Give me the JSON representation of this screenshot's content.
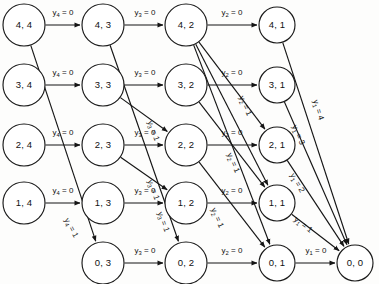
{
  "diagram": {
    "type": "directed-acyclic-network",
    "colors": {
      "background": "#fdfdfc",
      "node_fill": "#ffffff",
      "stroke": "#151515",
      "text": "#111111"
    },
    "columns": [
      {
        "id": "c4",
        "stage_label": "4",
        "x": 24
      },
      {
        "id": "c3",
        "stage_label": "3",
        "x": 103
      },
      {
        "id": "c2",
        "stage_label": "2",
        "x": 186
      },
      {
        "id": "c1",
        "stage_label": "1",
        "x": 277
      },
      {
        "id": "c0",
        "stage_label": "0",
        "x": 355
      }
    ],
    "rows": [
      {
        "id": "r4",
        "state_label": "4",
        "y": 25
      },
      {
        "id": "r3",
        "state_label": "3",
        "y": 85
      },
      {
        "id": "r2",
        "state_label": "2",
        "y": 145
      },
      {
        "id": "r1",
        "state_label": "1",
        "y": 203
      },
      {
        "id": "r0",
        "state_label": "0",
        "y": 263
      }
    ],
    "nodes": [
      {
        "id": "n44",
        "label": "4, 4",
        "x": 24,
        "y": 25,
        "r": 21
      },
      {
        "id": "n43",
        "label": "4, 3",
        "x": 103,
        "y": 25,
        "r": 21
      },
      {
        "id": "n42",
        "label": "4, 2",
        "x": 186,
        "y": 25,
        "r": 21
      },
      {
        "id": "n41",
        "label": "4, 1",
        "x": 277,
        "y": 25,
        "r": 18
      },
      {
        "id": "n34",
        "label": "3, 4",
        "x": 24,
        "y": 85,
        "r": 21
      },
      {
        "id": "n33",
        "label": "3, 3",
        "x": 103,
        "y": 85,
        "r": 21
      },
      {
        "id": "n32",
        "label": "3, 2",
        "x": 186,
        "y": 85,
        "r": 21
      },
      {
        "id": "n31",
        "label": "3, 1",
        "x": 277,
        "y": 85,
        "r": 18
      },
      {
        "id": "n24",
        "label": "2, 4",
        "x": 24,
        "y": 145,
        "r": 21
      },
      {
        "id": "n23",
        "label": "2, 3",
        "x": 103,
        "y": 145,
        "r": 21
      },
      {
        "id": "n22",
        "label": "2, 2",
        "x": 186,
        "y": 145,
        "r": 21
      },
      {
        "id": "n21",
        "label": "2, 1",
        "x": 277,
        "y": 145,
        "r": 18
      },
      {
        "id": "n14",
        "label": "1, 4",
        "x": 24,
        "y": 203,
        "r": 21
      },
      {
        "id": "n13",
        "label": "1, 3",
        "x": 103,
        "y": 203,
        "r": 21
      },
      {
        "id": "n12",
        "label": "1, 2",
        "x": 186,
        "y": 203,
        "r": 21
      },
      {
        "id": "n11",
        "label": "1, 1",
        "x": 277,
        "y": 203,
        "r": 18
      },
      {
        "id": "n03",
        "label": "0, 3",
        "x": 103,
        "y": 263,
        "r": 21
      },
      {
        "id": "n02",
        "label": "0, 2",
        "x": 186,
        "y": 263,
        "r": 21
      },
      {
        "id": "n01",
        "label": "0, 1",
        "x": 277,
        "y": 263,
        "r": 18
      },
      {
        "id": "n00",
        "label": "0, 0",
        "x": 355,
        "y": 263,
        "r": 18
      }
    ],
    "edges": [
      {
        "id": "e1",
        "from": "n44",
        "to": "n43",
        "var": "y",
        "sub": "4",
        "value": "0",
        "label": "y4 = 0",
        "label_x": 63,
        "label_y": 13,
        "rotate": 0
      },
      {
        "id": "e2",
        "from": "n34",
        "to": "n33",
        "var": "y",
        "sub": "4",
        "value": "0",
        "label": "y4 = 0",
        "label_x": 63,
        "label_y": 73,
        "rotate": 0
      },
      {
        "id": "e3",
        "from": "n24",
        "to": "n23",
        "var": "y",
        "sub": "4",
        "value": "0",
        "label": "y4 = 0",
        "label_x": 63,
        "label_y": 133,
        "rotate": 0
      },
      {
        "id": "e4",
        "from": "n14",
        "to": "n13",
        "var": "y",
        "sub": "4",
        "value": "0",
        "label": "y4 = 0",
        "label_x": 63,
        "label_y": 191,
        "rotate": 0
      },
      {
        "id": "e5",
        "from": "n44",
        "to": "n03",
        "var": "y",
        "sub": "4",
        "value": "1",
        "label": "y4 = 1",
        "label_x": 71,
        "label_y": 228,
        "rotate": 62
      },
      {
        "id": "e6",
        "from": "n43",
        "to": "n42",
        "var": "y",
        "sub": "3",
        "value": "0",
        "label": "y3 = 0",
        "label_x": 145,
        "label_y": 13,
        "rotate": 0
      },
      {
        "id": "e7",
        "from": "n33",
        "to": "n32",
        "var": "y",
        "sub": "3",
        "value": "0",
        "label": "y3 = 0",
        "label_x": 145,
        "label_y": 73,
        "rotate": 0
      },
      {
        "id": "e8",
        "from": "n23",
        "to": "n22",
        "var": "y",
        "sub": "3",
        "value": "0",
        "label": "y3 = 0",
        "label_x": 145,
        "label_y": 133,
        "rotate": 0
      },
      {
        "id": "e9",
        "from": "n13",
        "to": "n12",
        "var": "y",
        "sub": "3",
        "value": "0",
        "label": "y3 = 0",
        "label_x": 145,
        "label_y": 191,
        "rotate": 0
      },
      {
        "id": "e10",
        "from": "n03",
        "to": "n02",
        "var": "y",
        "sub": "3",
        "value": "0",
        "label": "y3 = 0",
        "label_x": 145,
        "label_y": 251,
        "rotate": 0
      },
      {
        "id": "e11",
        "from": "n43",
        "to": "n02",
        "var": "y",
        "sub": "3",
        "value": "1",
        "label": "y3 = 1",
        "label_x": 163,
        "label_y": 222,
        "rotate": 70
      },
      {
        "id": "e12",
        "from": "n33",
        "to": "n22",
        "var": "y",
        "sub": "3",
        "value": "1",
        "label": "y3 = 1",
        "label_x": 153,
        "label_y": 131,
        "rotate": 70
      },
      {
        "id": "e13",
        "from": "n23",
        "to": "n12",
        "var": "y",
        "sub": "3",
        "value": "1",
        "label": "y3 = 1",
        "label_x": 153,
        "label_y": 190,
        "rotate": 70
      },
      {
        "id": "e14",
        "from": "n42",
        "to": "n41",
        "var": "y",
        "sub": "2",
        "value": "0",
        "label": "y2 = 0",
        "label_x": 232,
        "label_y": 13,
        "rotate": 0
      },
      {
        "id": "e15",
        "from": "n32",
        "to": "n31",
        "var": "y",
        "sub": "2",
        "value": "0",
        "label": "y2 = 0",
        "label_x": 232,
        "label_y": 73,
        "rotate": 0
      },
      {
        "id": "e16",
        "from": "n22",
        "to": "n21",
        "var": "y",
        "sub": "2",
        "value": "0",
        "label": "y2 = 0",
        "label_x": 232,
        "label_y": 133,
        "rotate": 0
      },
      {
        "id": "e17",
        "from": "n12",
        "to": "n11",
        "var": "y",
        "sub": "2",
        "value": "0",
        "label": "y2 = 0",
        "label_x": 232,
        "label_y": 191,
        "rotate": 0
      },
      {
        "id": "e18",
        "from": "n02",
        "to": "n01",
        "var": "y",
        "sub": "2",
        "value": "0",
        "label": "y2 = 0",
        "label_x": 232,
        "label_y": 251,
        "rotate": 0
      },
      {
        "id": "e19",
        "from": "n42",
        "to": "n21",
        "var": "y",
        "sub": "2",
        "value": "1",
        "label": "y2 = 1",
        "label_x": 245,
        "label_y": 106,
        "rotate": 66
      },
      {
        "id": "e20",
        "from": "n42",
        "to": "n11",
        "var": "y",
        "sub": "2",
        "value": "1",
        "label": "y2 = 1",
        "label_x": 233,
        "label_y": 163,
        "rotate": 66
      },
      {
        "id": "e21",
        "from": "n42",
        "to": "n01",
        "var": "y",
        "sub": "2",
        "value": "1",
        "label": "y2 = 1",
        "label_x": 217,
        "label_y": 218,
        "rotate": 66
      },
      {
        "id": "e22",
        "from": "n32",
        "to": "n11",
        "var": "y",
        "sub": "2",
        "value": "1",
        "label": "",
        "label_x": 0,
        "label_y": 0,
        "rotate": 0
      },
      {
        "id": "e23",
        "from": "n22",
        "to": "n01",
        "var": "y",
        "sub": "2",
        "value": "1",
        "label": "",
        "label_x": 0,
        "label_y": 0,
        "rotate": 0
      },
      {
        "id": "e24",
        "from": "n41",
        "to": "n00",
        "var": "y",
        "sub": "1",
        "value": "4",
        "label": "y1 = 4",
        "label_x": 318,
        "label_y": 110,
        "rotate": 73
      },
      {
        "id": "e25",
        "from": "n31",
        "to": "n00",
        "var": "y",
        "sub": "1",
        "value": "3",
        "label": "y1 = 3",
        "label_x": 298,
        "label_y": 135,
        "rotate": 67
      },
      {
        "id": "e26",
        "from": "n21",
        "to": "n00",
        "var": "y",
        "sub": "1",
        "value": "2",
        "label": "y1 = 2",
        "label_x": 297,
        "label_y": 183,
        "rotate": 60
      },
      {
        "id": "e27",
        "from": "n11",
        "to": "n00",
        "var": "y",
        "sub": "1",
        "value": "1",
        "label": "y1 = 1",
        "label_x": 303,
        "label_y": 225,
        "rotate": 38
      },
      {
        "id": "e28",
        "from": "n01",
        "to": "n00",
        "var": "y",
        "sub": "1",
        "value": "0",
        "label": "y1 = 0",
        "label_x": 316,
        "label_y": 251,
        "rotate": 0
      }
    ]
  }
}
